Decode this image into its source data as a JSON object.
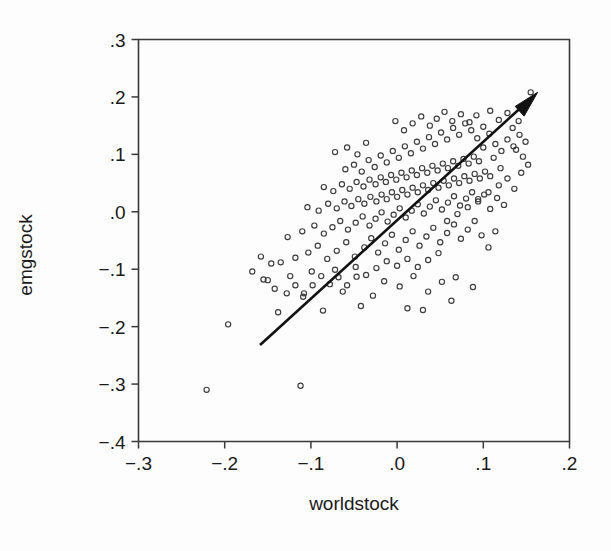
{
  "figure": {
    "background_color": "#fdfdfd",
    "ink_color": "#1a1a1a",
    "point_color": "#3d3d3d",
    "arrow_color": "#121212"
  },
  "axes": {
    "x_title": "worldstock",
    "y_title": "emgstock",
    "x_ticks": [
      "−.3",
      "−.2",
      "−.1",
      ".0",
      ".1",
      ".2"
    ],
    "y_ticks": [
      ".3",
      ".2",
      ".1",
      ".0",
      "−.1",
      "−.2",
      "−.3",
      "−.4"
    ]
  },
  "chart_data": {
    "type": "scatter",
    "title": "",
    "xlabel": "worldstock",
    "ylabel": "emgstock",
    "xlim": [
      -0.3,
      0.2
    ],
    "ylim": [
      -0.4,
      0.3
    ],
    "xticks": [
      -0.3,
      -0.2,
      -0.1,
      0.0,
      0.1,
      0.2
    ],
    "yticks": [
      -0.4,
      -0.3,
      -0.2,
      -0.1,
      0.0,
      0.1,
      0.2,
      0.3
    ],
    "xtick_labels": [
      "−.3",
      "−.2",
      "−.1",
      ".0",
      ".1",
      ".2"
    ],
    "ytick_labels": [
      "−.4",
      "−.3",
      "−.2",
      "−.1",
      ".0",
      ".1",
      ".2",
      ".3"
    ],
    "grid": false,
    "legend": false,
    "marker": "open-circle",
    "annotations": [
      {
        "type": "arrow",
        "label": "regression-trend-arrow",
        "x_start": -0.159,
        "y_start": -0.232,
        "x_end": 0.163,
        "y_end": 0.208,
        "description": "Solid upward-sloping arrow indicating positive linear relationship"
      }
    ],
    "points": [
      [
        -0.221,
        -0.31
      ],
      [
        -0.112,
        -0.303
      ],
      [
        -0.196,
        -0.196
      ],
      [
        -0.138,
        -0.175
      ],
      [
        -0.086,
        -0.172
      ],
      [
        -0.109,
        -0.148
      ],
      [
        -0.063,
        -0.139
      ],
      [
        -0.15,
        -0.119
      ],
      [
        -0.124,
        -0.112
      ],
      [
        -0.099,
        -0.104
      ],
      [
        -0.072,
        -0.101
      ],
      [
        -0.047,
        -0.113
      ],
      [
        -0.028,
        -0.146
      ],
      [
        -0.015,
        -0.121
      ],
      [
        0.003,
        -0.13
      ],
      [
        0.019,
        -0.112
      ],
      [
        0.036,
        -0.139
      ],
      [
        0.052,
        -0.122
      ],
      [
        0.068,
        -0.114
      ],
      [
        0.012,
        -0.168
      ],
      [
        -0.042,
        -0.164
      ],
      [
        0.03,
        -0.171
      ],
      [
        0.063,
        -0.155
      ],
      [
        0.088,
        -0.131
      ],
      [
        -0.135,
        -0.088
      ],
      [
        -0.118,
        -0.08
      ],
      [
        -0.103,
        -0.071
      ],
      [
        -0.092,
        -0.059
      ],
      [
        -0.081,
        -0.082
      ],
      [
        -0.07,
        -0.068
      ],
      [
        -0.059,
        -0.053
      ],
      [
        -0.049,
        -0.078
      ],
      [
        -0.038,
        -0.062
      ],
      [
        -0.03,
        -0.046
      ],
      [
        -0.022,
        -0.071
      ],
      [
        -0.014,
        -0.055
      ],
      [
        -0.006,
        -0.04
      ],
      [
        0.002,
        -0.066
      ],
      [
        0.01,
        -0.049
      ],
      [
        0.018,
        -0.034
      ],
      [
        0.026,
        -0.059
      ],
      [
        0.034,
        -0.043
      ],
      [
        0.042,
        -0.028
      ],
      [
        0.05,
        -0.053
      ],
      [
        0.058,
        -0.037
      ],
      [
        0.066,
        -0.022
      ],
      [
        0.074,
        -0.047
      ],
      [
        0.082,
        -0.031
      ],
      [
        0.09,
        -0.016
      ],
      [
        0.098,
        -0.041
      ],
      [
        0.106,
        -0.062
      ],
      [
        0.114,
        -0.034
      ],
      [
        -0.127,
        -0.044
      ],
      [
        -0.11,
        -0.034
      ],
      [
        -0.096,
        -0.024
      ],
      [
        -0.085,
        -0.038
      ],
      [
        -0.075,
        -0.027
      ],
      [
        -0.066,
        -0.016
      ],
      [
        -0.057,
        -0.031
      ],
      [
        -0.048,
        -0.019
      ],
      [
        -0.04,
        -0.008
      ],
      [
        -0.032,
        -0.024
      ],
      [
        -0.025,
        -0.012
      ],
      [
        -0.018,
        -0.001
      ],
      [
        -0.011,
        -0.017
      ],
      [
        -0.004,
        -0.005
      ],
      [
        0.003,
        0.006
      ],
      [
        0.01,
        -0.01
      ],
      [
        0.017,
        0.002
      ],
      [
        0.024,
        0.013
      ],
      [
        0.031,
        -0.003
      ],
      [
        0.038,
        0.009
      ],
      [
        0.045,
        0.02
      ],
      [
        0.052,
        0.004
      ],
      [
        0.059,
        0.016
      ],
      [
        0.066,
        0.027
      ],
      [
        0.073,
        0.011
      ],
      [
        0.08,
        0.023
      ],
      [
        0.087,
        0.034
      ],
      [
        0.094,
        0.018
      ],
      [
        0.101,
        0.03
      ],
      [
        0.108,
        0.005
      ],
      [
        0.116,
        0.024
      ],
      [
        0.124,
        0.012
      ],
      [
        -0.104,
        0.008
      ],
      [
        -0.091,
        0.002
      ],
      [
        -0.08,
        0.014
      ],
      [
        -0.07,
        0.006
      ],
      [
        -0.061,
        0.018
      ],
      [
        -0.053,
        0.01
      ],
      [
        -0.045,
        0.022
      ],
      [
        -0.038,
        0.014
      ],
      [
        -0.031,
        0.026
      ],
      [
        -0.024,
        0.018
      ],
      [
        -0.018,
        0.03
      ],
      [
        -0.012,
        0.022
      ],
      [
        -0.006,
        0.034
      ],
      [
        0.0,
        0.026
      ],
      [
        0.006,
        0.038
      ],
      [
        0.012,
        0.03
      ],
      [
        0.018,
        0.042
      ],
      [
        0.024,
        0.034
      ],
      [
        0.03,
        0.046
      ],
      [
        0.036,
        0.038
      ],
      [
        0.042,
        0.05
      ],
      [
        0.048,
        0.042
      ],
      [
        0.054,
        0.054
      ],
      [
        0.06,
        0.046
      ],
      [
        0.066,
        0.058
      ],
      [
        0.072,
        0.05
      ],
      [
        0.078,
        0.062
      ],
      [
        0.084,
        0.054
      ],
      [
        0.09,
        0.066
      ],
      [
        0.096,
        0.058
      ],
      [
        0.102,
        0.07
      ],
      [
        0.108,
        0.062
      ],
      [
        -0.085,
        0.043
      ],
      [
        -0.074,
        0.036
      ],
      [
        -0.064,
        0.048
      ],
      [
        -0.055,
        0.04
      ],
      [
        -0.047,
        0.052
      ],
      [
        -0.039,
        0.044
      ],
      [
        -0.032,
        0.056
      ],
      [
        -0.025,
        0.048
      ],
      [
        -0.019,
        0.06
      ],
      [
        -0.013,
        0.052
      ],
      [
        -0.007,
        0.064
      ],
      [
        -0.001,
        0.056
      ],
      [
        0.005,
        0.068
      ],
      [
        0.011,
        0.06
      ],
      [
        0.017,
        0.072
      ],
      [
        0.023,
        0.064
      ],
      [
        0.029,
        0.076
      ],
      [
        0.035,
        0.068
      ],
      [
        0.041,
        0.08
      ],
      [
        0.047,
        0.072
      ],
      [
        0.053,
        0.084
      ],
      [
        0.059,
        0.076
      ],
      [
        0.065,
        0.088
      ],
      [
        0.071,
        0.08
      ],
      [
        0.077,
        0.092
      ],
      [
        0.083,
        0.084
      ],
      [
        0.089,
        0.096
      ],
      [
        0.095,
        0.088
      ],
      [
        -0.06,
        0.074
      ],
      [
        -0.05,
        0.082
      ],
      [
        -0.041,
        0.07
      ],
      [
        -0.033,
        0.09
      ],
      [
        -0.026,
        0.078
      ],
      [
        -0.019,
        0.098
      ],
      [
        -0.012,
        0.086
      ],
      [
        -0.005,
        0.106
      ],
      [
        0.002,
        0.094
      ],
      [
        0.009,
        0.114
      ],
      [
        0.016,
        0.102
      ],
      [
        0.023,
        0.122
      ],
      [
        0.03,
        0.11
      ],
      [
        0.037,
        0.13
      ],
      [
        0.044,
        0.118
      ],
      [
        0.051,
        0.138
      ],
      [
        0.058,
        0.126
      ],
      [
        0.065,
        0.146
      ],
      [
        0.072,
        0.134
      ],
      [
        0.079,
        0.154
      ],
      [
        0.086,
        0.142
      ],
      [
        0.093,
        0.128
      ],
      [
        0.1,
        0.148
      ],
      [
        0.107,
        0.136
      ],
      [
        -0.072,
        0.104
      ],
      [
        -0.058,
        0.112
      ],
      [
        -0.046,
        0.1
      ],
      [
        -0.036,
        0.12
      ],
      [
        0.114,
        0.118
      ],
      [
        0.121,
        0.106
      ],
      [
        0.128,
        0.126
      ],
      [
        0.135,
        0.114
      ],
      [
        0.142,
        0.134
      ],
      [
        0.149,
        0.122
      ],
      [
        0.134,
        0.146
      ],
      [
        0.141,
        0.158
      ],
      [
        0.155,
        0.208
      ],
      [
        0.128,
        0.172
      ],
      [
        0.118,
        0.16
      ],
      [
        0.108,
        0.176
      ],
      [
        0.046,
        0.162
      ],
      [
        0.038,
        0.15
      ],
      [
        0.028,
        0.166
      ],
      [
        0.018,
        0.154
      ],
      [
        0.008,
        0.142
      ],
      [
        -0.002,
        0.158
      ],
      [
        0.055,
        0.174
      ],
      [
        0.064,
        0.158
      ],
      [
        0.074,
        0.17
      ],
      [
        0.084,
        0.156
      ],
      [
        0.092,
        0.168
      ],
      [
        0.1,
        0.112
      ],
      [
        0.112,
        0.094
      ],
      [
        0.12,
        0.076
      ],
      [
        0.128,
        0.058
      ],
      [
        0.136,
        0.04
      ],
      [
        0.118,
        0.046
      ],
      [
        0.106,
        0.034
      ],
      [
        0.094,
        0.022
      ],
      [
        0.082,
        0.008
      ],
      [
        0.07,
        -0.004
      ],
      [
        0.058,
        -0.016
      ],
      [
        0.048,
        -0.072
      ],
      [
        0.036,
        -0.084
      ],
      [
        0.024,
        -0.096
      ],
      [
        0.012,
        -0.082
      ],
      [
        0.0,
        -0.094
      ],
      [
        -0.012,
        -0.086
      ],
      [
        -0.024,
        -0.098
      ],
      [
        -0.036,
        -0.11
      ],
      [
        -0.048,
        -0.096
      ],
      [
        -0.058,
        -0.128
      ],
      [
        -0.068,
        -0.114
      ],
      [
        -0.078,
        -0.126
      ],
      [
        -0.088,
        -0.112
      ],
      [
        -0.098,
        -0.128
      ],
      [
        -0.108,
        -0.142
      ],
      [
        -0.118,
        -0.128
      ],
      [
        -0.128,
        -0.142
      ],
      [
        -0.142,
        -0.134
      ],
      [
        -0.155,
        -0.118
      ],
      [
        -0.168,
        -0.104
      ],
      [
        -0.146,
        -0.09
      ],
      [
        -0.158,
        -0.078
      ],
      [
        0.146,
        0.096
      ],
      [
        0.152,
        0.082
      ],
      [
        0.144,
        0.068
      ],
      [
        0.138,
        0.108
      ]
    ]
  }
}
